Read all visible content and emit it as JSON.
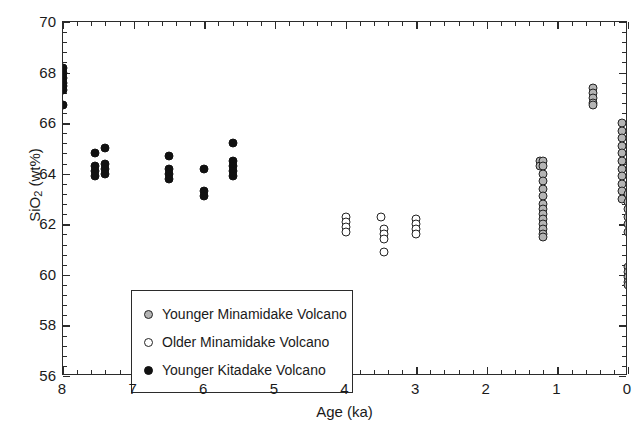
{
  "chart_data": {
    "type": "scatter",
    "title": "",
    "xlabel": "Age (ka)",
    "ylabel": "SiO2 (wt%)",
    "ylabel_base": "SiO",
    "ylabel_sub": "2",
    "ylabel_rest": " (wt%)",
    "xlim": [
      8,
      0
    ],
    "ylim": [
      56,
      70
    ],
    "x_reversed": true,
    "xticks": [
      8,
      7,
      6,
      5,
      4,
      3,
      2,
      1,
      0
    ],
    "xtick_labels": [
      "8",
      "7",
      "6",
      "5",
      "4",
      "3",
      "2",
      "1",
      "0"
    ],
    "yticks": [
      56,
      58,
      60,
      62,
      64,
      66,
      68,
      70
    ],
    "ytick_labels": [
      "56",
      "58",
      "60",
      "62",
      "64",
      "66",
      "68",
      "70"
    ],
    "x_minor_step": 0.2,
    "y_minor_step": 0.4,
    "grid": false,
    "legend_position": "lower-left-inside",
    "series": [
      {
        "name": "Younger Minamidake Volcano",
        "marker": "circle-gray-filled",
        "color": "#b4b4b4",
        "edge_color": "#222222",
        "points": [
          [
            1.25,
            64.5
          ],
          [
            1.25,
            64.3
          ],
          [
            1.2,
            64.5
          ],
          [
            1.2,
            64.3
          ],
          [
            1.2,
            64.0
          ],
          [
            1.2,
            63.7
          ],
          [
            1.2,
            63.4
          ],
          [
            1.2,
            63.1
          ],
          [
            1.2,
            62.8
          ],
          [
            1.2,
            62.6
          ],
          [
            1.2,
            62.4
          ],
          [
            1.2,
            62.2
          ],
          [
            1.2,
            62.0
          ],
          [
            1.2,
            61.8
          ],
          [
            1.2,
            61.6
          ],
          [
            1.2,
            61.5
          ],
          [
            0.5,
            67.4
          ],
          [
            0.5,
            67.2
          ],
          [
            0.5,
            67.0
          ],
          [
            0.5,
            66.8
          ],
          [
            0.5,
            66.7
          ],
          [
            0.08,
            66.0
          ],
          [
            0.08,
            65.7
          ],
          [
            0.08,
            65.4
          ],
          [
            0.08,
            65.1
          ],
          [
            0.08,
            64.8
          ],
          [
            0.08,
            64.5
          ],
          [
            0.08,
            64.2
          ],
          [
            0.08,
            63.9
          ],
          [
            0.08,
            63.6
          ],
          [
            0.08,
            63.3
          ],
          [
            0.08,
            63.0
          ],
          [
            0.0,
            63.2
          ],
          [
            0.0,
            62.9
          ],
          [
            0.0,
            62.6
          ],
          [
            0.0,
            62.3
          ],
          [
            0.0,
            62.0
          ],
          [
            0.0,
            61.7
          ],
          [
            0.0,
            60.3
          ],
          [
            0.0,
            60.1
          ],
          [
            0.0,
            59.9
          ],
          [
            0.0,
            59.7
          ],
          [
            0.0,
            59.6
          ]
        ]
      },
      {
        "name": "Older Minamidake Volcano",
        "marker": "circle-open",
        "color": "#ffffff",
        "edge_color": "#222222",
        "points": [
          [
            4.0,
            62.3
          ],
          [
            4.0,
            62.1
          ],
          [
            4.0,
            61.9
          ],
          [
            4.0,
            61.7
          ],
          [
            3.5,
            62.3
          ],
          [
            3.45,
            61.8
          ],
          [
            3.45,
            61.6
          ],
          [
            3.45,
            61.4
          ],
          [
            3.45,
            60.9
          ],
          [
            3.0,
            62.2
          ],
          [
            3.0,
            62.0
          ],
          [
            3.0,
            61.8
          ],
          [
            3.0,
            61.6
          ]
        ]
      },
      {
        "name": "Younger Kitadake Volcano",
        "marker": "circle-black-filled",
        "color": "#111111",
        "edge_color": "#111111",
        "points": [
          [
            8.0,
            68.2
          ],
          [
            8.0,
            68.0
          ],
          [
            8.0,
            67.8
          ],
          [
            8.0,
            67.6
          ],
          [
            8.0,
            67.45
          ],
          [
            8.0,
            67.3
          ],
          [
            8.0,
            66.7
          ],
          [
            7.55,
            64.8
          ],
          [
            7.55,
            64.3
          ],
          [
            7.55,
            64.1
          ],
          [
            7.55,
            63.9
          ],
          [
            7.4,
            65.0
          ],
          [
            7.4,
            64.4
          ],
          [
            7.4,
            64.2
          ],
          [
            7.4,
            64.0
          ],
          [
            6.5,
            64.7
          ],
          [
            6.5,
            64.2
          ],
          [
            6.5,
            64.0
          ],
          [
            6.5,
            63.8
          ],
          [
            6.0,
            64.2
          ],
          [
            6.0,
            63.3
          ],
          [
            6.0,
            63.1
          ],
          [
            5.6,
            65.2
          ],
          [
            5.6,
            64.5
          ],
          [
            5.6,
            64.3
          ],
          [
            5.6,
            64.1
          ],
          [
            5.6,
            63.9
          ]
        ]
      }
    ]
  },
  "legend": {
    "items": [
      {
        "label": "Younger Minamidake Volcano",
        "marker_class": "m-younger-minamidake"
      },
      {
        "label": "Older Minamidake Volcano",
        "marker_class": "m-older-minamidake"
      },
      {
        "label": "Younger Kitadake Volcano",
        "marker_class": "m-younger-kitadake"
      }
    ]
  }
}
